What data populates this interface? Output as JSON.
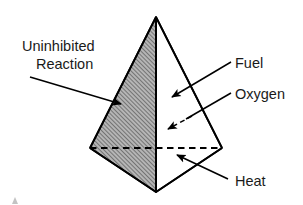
{
  "figure": {
    "type": "diagram",
    "background_color": "#ffffff",
    "stroke_color": "#000000",
    "shaded_face_fill": "#a8a8a8",
    "hatch_color": "#4a4a4a",
    "text_color": "#1a1a1a"
  },
  "shape": {
    "name": "tetrahedron",
    "vertices": {
      "apex": {
        "x": 156,
        "y": 17
      },
      "left": {
        "x": 90,
        "y": 148
      },
      "right": {
        "x": 222,
        "y": 148
      },
      "bottom_front": {
        "x": 156,
        "y": 192
      }
    },
    "hidden_edge_style": "dashed",
    "shaded_face": "left-front"
  },
  "labels": [
    {
      "id": "uninhibited-reaction",
      "line1": "Uninhibited",
      "line2": "Reaction",
      "x": 22,
      "y1": 47,
      "y2": 64,
      "leader": {
        "from_x": 30,
        "from_y": 77,
        "to_x": 121,
        "to_y": 104
      },
      "arrow_style": "solid"
    },
    {
      "id": "fuel",
      "text": "Fuel",
      "x": 235,
      "y": 64,
      "leader": {
        "from_x": 231,
        "from_y": 62,
        "to_x": 172,
        "to_y": 97
      },
      "arrow_style": "solid"
    },
    {
      "id": "oxygen",
      "text": "Oxygen",
      "x": 235,
      "y": 95,
      "leader": {
        "from_x": 231,
        "from_y": 93,
        "to_x": 170,
        "to_y": 128
      },
      "arrow_style": "dashed"
    },
    {
      "id": "heat",
      "text": "Heat",
      "x": 235,
      "y": 182,
      "leader": {
        "from_x": 228,
        "from_y": 179,
        "to_x": 177,
        "to_y": 155
      },
      "arrow_style": "solid"
    }
  ]
}
